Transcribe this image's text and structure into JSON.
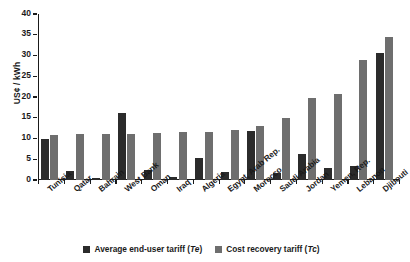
{
  "chart_data": {
    "type": "bar",
    "title": "",
    "xlabel": "",
    "ylabel": "US¢ / kWh",
    "ylim": [
      0,
      40
    ],
    "yticks": [
      0,
      5,
      10,
      15,
      20,
      25,
      30,
      35,
      40
    ],
    "grid": false,
    "legend_position": "bottom-center",
    "categories": [
      "Tunisia",
      "Qatar",
      "Bahrain",
      "West Bank",
      "Oman",
      "Iraq",
      "Algeria",
      "Egypt, Arab Rep.",
      "Morocco",
      "Saudi Arabia",
      "Jordan",
      "Yemen, Rep.",
      "Lebanon",
      "Djibouti"
    ],
    "series": [
      {
        "name": "Average end-user tariff (Te)",
        "name_text": "Average end-user tariff (",
        "name_italic": "Te",
        "name_tail": ")",
        "color": "#2b2b2b",
        "values": [
          10.0,
          2.2,
          0.6,
          16.2,
          2.5,
          0.7,
          5.3,
          2.0,
          11.7,
          1.7,
          6.3,
          3.0,
          3.3,
          30.5
        ]
      },
      {
        "name": "Cost recovery tariff (Tc)",
        "name_text": "Cost recovery tariff (",
        "name_italic": "Tc",
        "name_tail": ")",
        "color": "#6e6e6e",
        "values": [
          10.8,
          11.1,
          11.1,
          11.2,
          11.4,
          11.5,
          11.6,
          12.0,
          13.0,
          14.9,
          19.8,
          20.8,
          29.0,
          34.5
        ]
      }
    ]
  }
}
